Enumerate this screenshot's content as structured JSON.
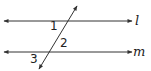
{
  "diagram": {
    "type": "parallel-lines-transversal",
    "lines": [
      {
        "name": "l",
        "label": "l",
        "y": 21,
        "x1": 4,
        "x2": 132
      },
      {
        "name": "m",
        "label": "m",
        "y": 52,
        "x1": 4,
        "x2": 132
      }
    ],
    "transversal": {
      "x1": 77,
      "y1": 6,
      "x2": 39,
      "y2": 69
    },
    "angles": [
      {
        "label": "1",
        "x": 54,
        "y": 30
      },
      {
        "label": "2",
        "x": 64,
        "y": 46
      },
      {
        "label": "3",
        "x": 35,
        "y": 62
      }
    ],
    "colors": {
      "stroke": "#333333",
      "text": "#222222"
    }
  }
}
